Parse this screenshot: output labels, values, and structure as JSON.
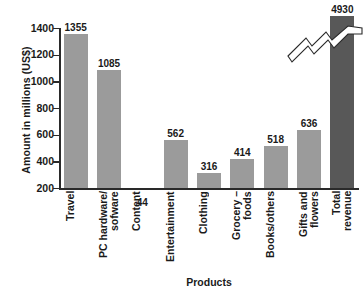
{
  "chart_data": {
    "type": "bar",
    "title": "",
    "xlabel": "Products",
    "ylabel": "Amount in millions (US$)",
    "ylim": [
      200,
      1400
    ],
    "yticks": [
      200,
      400,
      600,
      800,
      1000,
      1200,
      1400
    ],
    "grid": false,
    "legend": null,
    "axis_break": {
      "present": true,
      "on_category": "Total revenue",
      "symbol": "zigzag",
      "note": "bar is truncated; value exceeds axis range"
    },
    "categories": [
      "Travel",
      "PC hardware/\nsofware",
      "Content",
      "Entertainment",
      "Clothing",
      "Grocery –\nfoods",
      "Books/others",
      "Gifts and\nflowers",
      "Total\nrevenue"
    ],
    "values": [
      1355,
      1085,
      44,
      562,
      316,
      414,
      518,
      636,
      4930
    ],
    "value_labels": [
      "1355",
      "1085",
      "44",
      "562",
      "316",
      "414",
      "518",
      "636",
      "4930"
    ],
    "colors": {
      "bar": "#9b9b9b",
      "accent_bar": "#585858",
      "axis": "#2a2a2a",
      "text": "#1a1a1a",
      "background": "#ffffff"
    }
  }
}
